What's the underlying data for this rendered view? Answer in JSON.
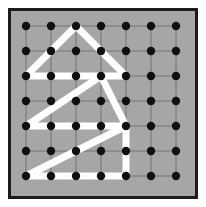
{
  "figure": {
    "type": "geoboard-diagram",
    "canvas": {
      "width": 206,
      "height": 207
    },
    "colors": {
      "page_background": "#ffffff",
      "board_fill": "#a6a6a6",
      "board_border": "#1c1c1c",
      "grid_line": "#6e6e6e",
      "peg_dot": "#101010",
      "path_stroke": "#ffffff"
    },
    "board": {
      "outer_x": 8,
      "outer_y": 8,
      "outer_width": 190,
      "outer_height": 191,
      "border_width": 3
    },
    "grid": {
      "rows": 7,
      "cols": 7,
      "origin_x": 26,
      "origin_y": 26,
      "spacing_x": 25,
      "spacing_y": 25,
      "dot_radius": 4.2,
      "grid_lines_visible": true,
      "grid_line_width": 0.9
    },
    "path": {
      "stroke_width": 7,
      "linecap": "round",
      "linejoin": "round",
      "closed": false,
      "description": "Zig-zag house/arrow figure drawn over the pegs",
      "segments": [
        {
          "name": "peak-to-left-base",
          "from": [
            2,
            0
          ],
          "to": [
            0,
            2
          ]
        },
        {
          "name": "peak-to-right-base",
          "from": [
            2,
            0
          ],
          "to": [
            4,
            2
          ]
        },
        {
          "name": "upper-horizontal",
          "from": [
            0,
            2
          ],
          "to": [
            4,
            2
          ]
        },
        {
          "name": "upper-diagonal-down-left",
          "from": [
            3,
            2
          ],
          "to": [
            0,
            4
          ]
        },
        {
          "name": "right-diagonal-down",
          "from": [
            3,
            2
          ],
          "to": [
            4,
            4
          ]
        },
        {
          "name": "middle-horizontal",
          "from": [
            0,
            4
          ],
          "to": [
            4,
            4
          ]
        },
        {
          "name": "lower-diagonal-down-left",
          "from": [
            4,
            4
          ],
          "to": [
            0,
            6
          ]
        },
        {
          "name": "right-vertical",
          "from": [
            4,
            4
          ],
          "to": [
            4,
            6
          ]
        },
        {
          "name": "bottom-horizontal",
          "from": [
            0,
            6
          ],
          "to": [
            4,
            6
          ]
        }
      ]
    }
  }
}
